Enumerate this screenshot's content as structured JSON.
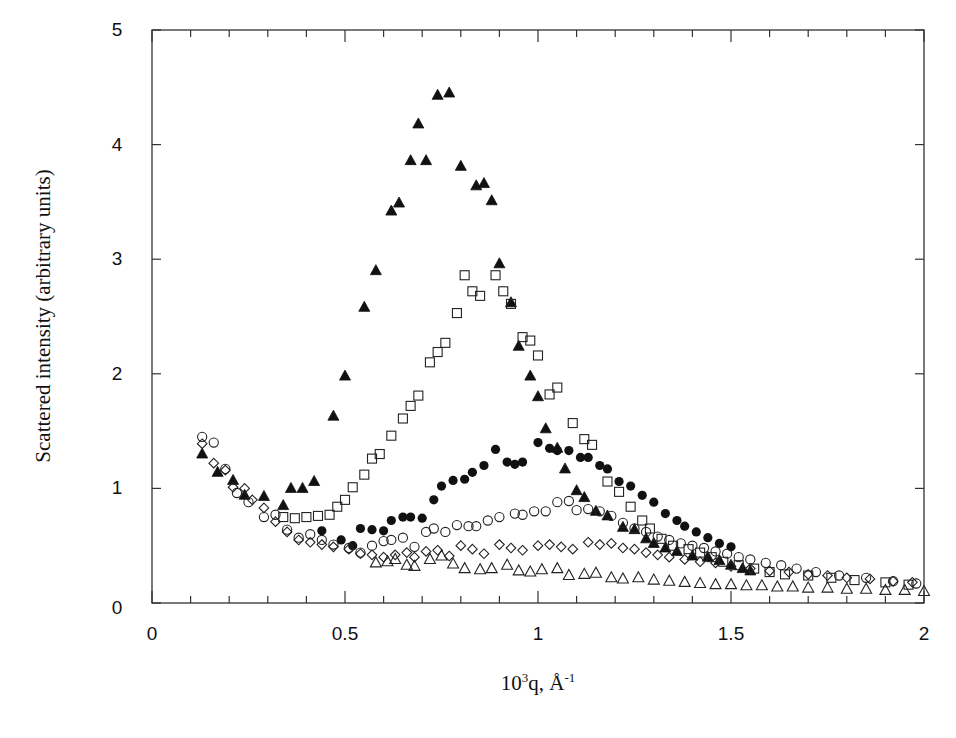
{
  "chart_data": {
    "type": "scatter",
    "title": "",
    "xlabel": "10^3 q, Å^-1",
    "xlabel_parts": {
      "base": "10",
      "sup1": "3",
      "mid": "q, Å",
      "sup2": "-1"
    },
    "ylabel": "Scattered intensity (arbitrary units)",
    "xlim": [
      0,
      2
    ],
    "ylim": [
      0,
      5
    ],
    "xticks": [
      0,
      0.5,
      1,
      1.5,
      2
    ],
    "xtick_labels": [
      "0",
      "0.5",
      "1",
      "1.5",
      "2"
    ],
    "xminor_step": 0.1,
    "yticks": [
      0,
      1,
      2,
      3,
      4,
      5
    ],
    "ytick_labels": [
      "0",
      "1",
      "2",
      "3",
      "4",
      "5"
    ],
    "grid": false,
    "legend": null,
    "series": [
      {
        "name": "filled-triangle",
        "marker": "triangle-filled",
        "points": [
          [
            0.13,
            1.3
          ],
          [
            0.17,
            1.14
          ],
          [
            0.21,
            1.07
          ],
          [
            0.24,
            0.94
          ],
          [
            0.29,
            0.93
          ],
          [
            0.34,
            0.85
          ],
          [
            0.36,
            1.0
          ],
          [
            0.39,
            1.0
          ],
          [
            0.42,
            1.06
          ],
          [
            0.47,
            1.63
          ],
          [
            0.5,
            1.98
          ],
          [
            0.55,
            2.58
          ],
          [
            0.58,
            2.9
          ],
          [
            0.62,
            3.42
          ],
          [
            0.64,
            3.49
          ],
          [
            0.67,
            3.86
          ],
          [
            0.69,
            4.18
          ],
          [
            0.71,
            3.86
          ],
          [
            0.74,
            4.43
          ],
          [
            0.77,
            4.45
          ],
          [
            0.8,
            3.81
          ],
          [
            0.84,
            3.64
          ],
          [
            0.86,
            3.66
          ],
          [
            0.88,
            3.51
          ],
          [
            0.9,
            2.96
          ],
          [
            0.93,
            2.62
          ],
          [
            0.95,
            2.24
          ],
          [
            0.98,
            1.98
          ],
          [
            1.0,
            1.8
          ],
          [
            1.02,
            1.52
          ],
          [
            1.05,
            1.35
          ],
          [
            1.07,
            1.17
          ],
          [
            1.1,
            0.98
          ],
          [
            1.12,
            0.92
          ],
          [
            1.15,
            0.8
          ],
          [
            1.18,
            0.76
          ],
          [
            1.22,
            0.66
          ],
          [
            1.25,
            0.64
          ],
          [
            1.28,
            0.56
          ],
          [
            1.3,
            0.52
          ],
          [
            1.33,
            0.48
          ],
          [
            1.36,
            0.45
          ],
          [
            1.4,
            0.41
          ],
          [
            1.44,
            0.4
          ],
          [
            1.47,
            0.37
          ],
          [
            1.5,
            0.33
          ],
          [
            1.53,
            0.3
          ],
          [
            1.55,
            0.28
          ]
        ]
      },
      {
        "name": "open-square",
        "marker": "square-open",
        "points": [
          [
            0.34,
            0.75
          ],
          [
            0.37,
            0.74
          ],
          [
            0.4,
            0.75
          ],
          [
            0.43,
            0.76
          ],
          [
            0.46,
            0.77
          ],
          [
            0.48,
            0.84
          ],
          [
            0.5,
            0.9
          ],
          [
            0.52,
            1.01
          ],
          [
            0.55,
            1.12
          ],
          [
            0.57,
            1.26
          ],
          [
            0.59,
            1.3
          ],
          [
            0.62,
            1.46
          ],
          [
            0.65,
            1.61
          ],
          [
            0.67,
            1.72
          ],
          [
            0.69,
            1.81
          ],
          [
            0.72,
            2.1
          ],
          [
            0.74,
            2.19
          ],
          [
            0.76,
            2.27
          ],
          [
            0.79,
            2.53
          ],
          [
            0.81,
            2.86
          ],
          [
            0.83,
            2.72
          ],
          [
            0.85,
            2.68
          ],
          [
            0.89,
            2.86
          ],
          [
            0.91,
            2.72
          ],
          [
            0.93,
            2.61
          ],
          [
            0.96,
            2.32
          ],
          [
            0.98,
            2.29
          ],
          [
            1.0,
            2.16
          ],
          [
            1.03,
            1.82
          ],
          [
            1.05,
            1.88
          ],
          [
            1.09,
            1.57
          ],
          [
            1.12,
            1.43
          ],
          [
            1.14,
            1.38
          ],
          [
            1.18,
            1.06
          ],
          [
            1.21,
            0.97
          ],
          [
            1.24,
            0.84
          ],
          [
            1.27,
            0.72
          ],
          [
            1.29,
            0.65
          ],
          [
            1.32,
            0.56
          ],
          [
            1.35,
            0.5
          ],
          [
            1.39,
            0.47
          ],
          [
            1.42,
            0.44
          ],
          [
            1.45,
            0.4
          ],
          [
            1.48,
            0.36
          ],
          [
            1.52,
            0.33
          ],
          [
            1.56,
            0.3
          ],
          [
            1.6,
            0.27
          ],
          [
            1.64,
            0.25
          ],
          [
            1.7,
            0.24
          ],
          [
            1.76,
            0.22
          ],
          [
            1.82,
            0.2
          ],
          [
            1.9,
            0.18
          ],
          [
            1.96,
            0.16
          ]
        ]
      },
      {
        "name": "filled-circle",
        "marker": "circle-filled",
        "points": [
          [
            0.44,
            0.63
          ],
          [
            0.49,
            0.55
          ],
          [
            0.52,
            0.5
          ],
          [
            0.54,
            0.65
          ],
          [
            0.57,
            0.64
          ],
          [
            0.6,
            0.63
          ],
          [
            0.62,
            0.72
          ],
          [
            0.65,
            0.75
          ],
          [
            0.67,
            0.75
          ],
          [
            0.7,
            0.74
          ],
          [
            0.73,
            0.9
          ],
          [
            0.75,
            1.02
          ],
          [
            0.78,
            1.07
          ],
          [
            0.81,
            1.08
          ],
          [
            0.83,
            1.14
          ],
          [
            0.86,
            1.2
          ],
          [
            0.89,
            1.34
          ],
          [
            0.92,
            1.23
          ],
          [
            0.94,
            1.21
          ],
          [
            0.96,
            1.23
          ],
          [
            1.0,
            1.4
          ],
          [
            1.03,
            1.35
          ],
          [
            1.05,
            1.33
          ],
          [
            1.08,
            1.33
          ],
          [
            1.11,
            1.27
          ],
          [
            1.13,
            1.27
          ],
          [
            1.16,
            1.2
          ],
          [
            1.18,
            1.17
          ],
          [
            1.21,
            1.06
          ],
          [
            1.24,
            1.02
          ],
          [
            1.27,
            0.94
          ],
          [
            1.3,
            0.88
          ],
          [
            1.33,
            0.78
          ],
          [
            1.36,
            0.72
          ],
          [
            1.38,
            0.67
          ],
          [
            1.41,
            0.62
          ],
          [
            1.44,
            0.57
          ],
          [
            1.47,
            0.52
          ],
          [
            1.5,
            0.49
          ]
        ]
      },
      {
        "name": "open-circle",
        "marker": "circle-open",
        "points": [
          [
            0.13,
            1.45
          ],
          [
            0.16,
            1.4
          ],
          [
            0.19,
            1.17
          ],
          [
            0.22,
            0.96
          ],
          [
            0.25,
            0.88
          ],
          [
            0.29,
            0.75
          ],
          [
            0.32,
            0.77
          ],
          [
            0.35,
            0.64
          ],
          [
            0.38,
            0.57
          ],
          [
            0.41,
            0.6
          ],
          [
            0.44,
            0.55
          ],
          [
            0.47,
            0.51
          ],
          [
            0.51,
            0.48
          ],
          [
            0.54,
            0.44
          ],
          [
            0.57,
            0.5
          ],
          [
            0.6,
            0.54
          ],
          [
            0.62,
            0.55
          ],
          [
            0.65,
            0.57
          ],
          [
            0.68,
            0.49
          ],
          [
            0.71,
            0.62
          ],
          [
            0.73,
            0.65
          ],
          [
            0.76,
            0.62
          ],
          [
            0.79,
            0.68
          ],
          [
            0.82,
            0.67
          ],
          [
            0.84,
            0.67
          ],
          [
            0.87,
            0.72
          ],
          [
            0.9,
            0.75
          ],
          [
            0.94,
            0.78
          ],
          [
            0.96,
            0.77
          ],
          [
            0.99,
            0.8
          ],
          [
            1.02,
            0.8
          ],
          [
            1.05,
            0.88
          ],
          [
            1.08,
            0.89
          ],
          [
            1.1,
            0.81
          ],
          [
            1.13,
            0.82
          ],
          [
            1.16,
            0.8
          ],
          [
            1.19,
            0.76
          ],
          [
            1.22,
            0.7
          ],
          [
            1.25,
            0.65
          ],
          [
            1.28,
            0.62
          ],
          [
            1.31,
            0.58
          ],
          [
            1.34,
            0.55
          ],
          [
            1.37,
            0.52
          ],
          [
            1.4,
            0.5
          ],
          [
            1.43,
            0.48
          ],
          [
            1.46,
            0.45
          ],
          [
            1.49,
            0.43
          ],
          [
            1.52,
            0.4
          ],
          [
            1.55,
            0.38
          ],
          [
            1.59,
            0.35
          ],
          [
            1.63,
            0.33
          ],
          [
            1.67,
            0.3
          ],
          [
            1.72,
            0.27
          ],
          [
            1.78,
            0.24
          ],
          [
            1.85,
            0.22
          ],
          [
            1.92,
            0.19
          ],
          [
            1.98,
            0.17
          ]
        ]
      },
      {
        "name": "open-diamond",
        "marker": "diamond-open",
        "points": [
          [
            0.13,
            1.39
          ],
          [
            0.16,
            1.22
          ],
          [
            0.19,
            1.16
          ],
          [
            0.21,
            1.01
          ],
          [
            0.24,
            1.0
          ],
          [
            0.26,
            0.9
          ],
          [
            0.29,
            0.83
          ],
          [
            0.32,
            0.71
          ],
          [
            0.35,
            0.62
          ],
          [
            0.38,
            0.55
          ],
          [
            0.41,
            0.53
          ],
          [
            0.44,
            0.51
          ],
          [
            0.47,
            0.49
          ],
          [
            0.51,
            0.47
          ],
          [
            0.54,
            0.43
          ],
          [
            0.57,
            0.42
          ],
          [
            0.6,
            0.4
          ],
          [
            0.63,
            0.42
          ],
          [
            0.66,
            0.44
          ],
          [
            0.68,
            0.4
          ],
          [
            0.71,
            0.45
          ],
          [
            0.74,
            0.46
          ],
          [
            0.77,
            0.41
          ],
          [
            0.8,
            0.5
          ],
          [
            0.83,
            0.47
          ],
          [
            0.86,
            0.43
          ],
          [
            0.9,
            0.51
          ],
          [
            0.93,
            0.48
          ],
          [
            0.96,
            0.46
          ],
          [
            1.0,
            0.5
          ],
          [
            1.03,
            0.51
          ],
          [
            1.06,
            0.49
          ],
          [
            1.09,
            0.47
          ],
          [
            1.13,
            0.53
          ],
          [
            1.16,
            0.51
          ],
          [
            1.19,
            0.52
          ],
          [
            1.22,
            0.48
          ],
          [
            1.25,
            0.47
          ],
          [
            1.28,
            0.44
          ],
          [
            1.31,
            0.42
          ],
          [
            1.34,
            0.4
          ],
          [
            1.38,
            0.38
          ],
          [
            1.42,
            0.36
          ],
          [
            1.46,
            0.35
          ],
          [
            1.5,
            0.32
          ],
          [
            1.55,
            0.3
          ],
          [
            1.6,
            0.28
          ],
          [
            1.65,
            0.27
          ],
          [
            1.7,
            0.25
          ],
          [
            1.75,
            0.24
          ],
          [
            1.8,
            0.22
          ],
          [
            1.86,
            0.21
          ],
          [
            1.92,
            0.19
          ],
          [
            1.97,
            0.18
          ]
        ]
      },
      {
        "name": "open-triangle",
        "marker": "triangle-open",
        "points": [
          [
            0.58,
            0.35
          ],
          [
            0.61,
            0.36
          ],
          [
            0.63,
            0.38
          ],
          [
            0.66,
            0.33
          ],
          [
            0.68,
            0.32
          ],
          [
            0.72,
            0.38
          ],
          [
            0.75,
            0.41
          ],
          [
            0.78,
            0.34
          ],
          [
            0.81,
            0.3
          ],
          [
            0.85,
            0.29
          ],
          [
            0.88,
            0.3
          ],
          [
            0.92,
            0.33
          ],
          [
            0.95,
            0.28
          ],
          [
            0.98,
            0.27
          ],
          [
            1.01,
            0.29
          ],
          [
            1.05,
            0.3
          ],
          [
            1.08,
            0.24
          ],
          [
            1.12,
            0.25
          ],
          [
            1.15,
            0.26
          ],
          [
            1.19,
            0.22
          ],
          [
            1.22,
            0.21
          ],
          [
            1.26,
            0.22
          ],
          [
            1.3,
            0.2
          ],
          [
            1.34,
            0.19
          ],
          [
            1.38,
            0.18
          ],
          [
            1.42,
            0.17
          ],
          [
            1.46,
            0.16
          ],
          [
            1.5,
            0.16
          ],
          [
            1.54,
            0.15
          ],
          [
            1.58,
            0.15
          ],
          [
            1.62,
            0.14
          ],
          [
            1.66,
            0.14
          ],
          [
            1.7,
            0.13
          ],
          [
            1.75,
            0.13
          ],
          [
            1.8,
            0.12
          ],
          [
            1.85,
            0.12
          ],
          [
            1.9,
            0.11
          ],
          [
            1.95,
            0.11
          ],
          [
            2.0,
            0.1
          ]
        ]
      }
    ]
  }
}
